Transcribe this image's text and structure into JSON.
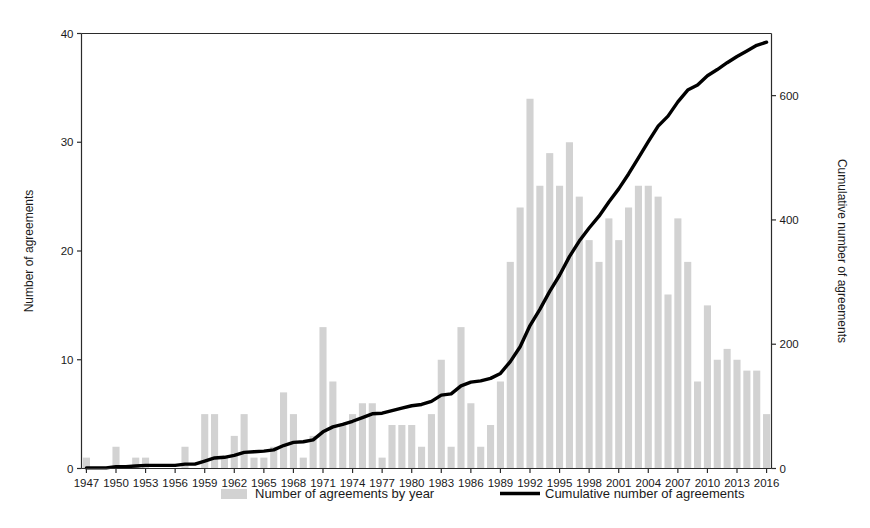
{
  "chart_data": {
    "type": "bar",
    "title": "",
    "subtitle": "",
    "xlabel": "",
    "ylabel": "Number of agreements",
    "y2label": "Cumulative number of agreements",
    "ylim": [
      0,
      40
    ],
    "y2lim": [
      0,
      700
    ],
    "yticks": [
      0,
      10,
      20,
      30,
      40
    ],
    "y2ticks": [
      0,
      200,
      400,
      600
    ],
    "grid": false,
    "legend_position": "bottom",
    "xticks": [
      "1947",
      "1950",
      "1953",
      "1956",
      "1959",
      "1962",
      "1965",
      "1968",
      "1971",
      "1974",
      "1977",
      "1980",
      "1983",
      "1986",
      "1989",
      "1992",
      "1995",
      "1998",
      "2001",
      "2004",
      "2007",
      "2010",
      "2013",
      "2016"
    ],
    "categories": [
      1947,
      1948,
      1949,
      1950,
      1951,
      1952,
      1953,
      1954,
      1955,
      1956,
      1957,
      1958,
      1959,
      1960,
      1961,
      1962,
      1963,
      1964,
      1965,
      1966,
      1967,
      1968,
      1969,
      1970,
      1971,
      1972,
      1973,
      1974,
      1975,
      1976,
      1977,
      1978,
      1979,
      1980,
      1981,
      1982,
      1983,
      1984,
      1985,
      1986,
      1987,
      1988,
      1989,
      1990,
      1991,
      1992,
      1993,
      1994,
      1995,
      1996,
      1997,
      1998,
      1999,
      2000,
      2001,
      2002,
      2003,
      2004,
      2005,
      2006,
      2007,
      2008,
      2009,
      2010,
      2011,
      2012,
      2013,
      2014,
      2015,
      2016
    ],
    "series": [
      {
        "name": "Number of agreements by year",
        "type": "bar",
        "color": "#d2d2d2",
        "axis": "left",
        "values": [
          1,
          0,
          0,
          2,
          0,
          1,
          1,
          0,
          0,
          0,
          2,
          0,
          5,
          5,
          1,
          3,
          5,
          1,
          1,
          2,
          7,
          5,
          1,
          3,
          13,
          8,
          4,
          5,
          6,
          6,
          1,
          4,
          4,
          4,
          2,
          5,
          10,
          2,
          13,
          6,
          2,
          4,
          8,
          19,
          24,
          34,
          26,
          29,
          26,
          30,
          25,
          21,
          19,
          23,
          21,
          24,
          26,
          26,
          25,
          16,
          23,
          19,
          8,
          15,
          10,
          11,
          10,
          9,
          9,
          5
        ]
      },
      {
        "name": "Cumulative number of agreements",
        "type": "line",
        "color": "#000000",
        "axis": "right",
        "values": [
          1,
          1,
          1,
          3,
          3,
          4,
          5,
          5,
          5,
          5,
          7,
          7,
          12,
          17,
          18,
          21,
          26,
          27,
          28,
          30,
          37,
          42,
          43,
          46,
          59,
          67,
          71,
          76,
          82,
          88,
          89,
          93,
          97,
          101,
          103,
          108,
          118,
          120,
          133,
          139,
          141,
          145,
          153,
          172,
          196,
          230,
          256,
          285,
          311,
          341,
          366,
          387,
          406,
          429,
          450,
          474,
          500,
          526,
          551,
          567,
          590,
          609,
          617,
          632,
          642,
          653,
          663,
          672,
          681,
          686
        ]
      }
    ]
  },
  "legend": {
    "items": [
      {
        "label": "Number of agreements by year",
        "marker": "bar-swatch",
        "color": "#d2d2d2"
      },
      {
        "label": "Cumulative number of agreements",
        "marker": "line-swatch",
        "color": "#000000"
      }
    ]
  },
  "axes": {
    "left_title": "Number of agreements",
    "right_title": "Cumulative number of agreements"
  }
}
